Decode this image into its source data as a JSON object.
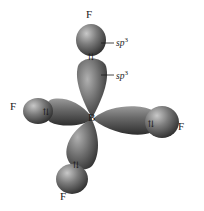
{
  "diagram": {
    "central_atom": {
      "label": "B",
      "x": 92,
      "y": 119
    },
    "ligands": [
      {
        "id": "top",
        "label": "F",
        "label_x": 86,
        "label_y": 18
      },
      {
        "id": "left",
        "label": "F",
        "label_x": 10,
        "label_y": 110
      },
      {
        "id": "right",
        "label": "F",
        "label_x": 178,
        "label_y": 130
      },
      {
        "id": "bottom",
        "label": "F",
        "label_x": 60,
        "label_y": 200
      }
    ],
    "annotations": [
      {
        "text": "sp",
        "sup": "3",
        "target": "fluorine orbital",
        "x": 116,
        "y": 46
      },
      {
        "text": "sp",
        "sup": "3",
        "target": "boron orbital",
        "x": 116,
        "y": 79
      }
    ],
    "electron_pair_symbol": "⇅",
    "colors": {
      "orbital_dark": "#3a3a3a",
      "orbital_mid": "#7a7a7a",
      "orbital_light": "#b8b8b8",
      "text": "#1a1a1a",
      "background": "#ffffff"
    }
  }
}
